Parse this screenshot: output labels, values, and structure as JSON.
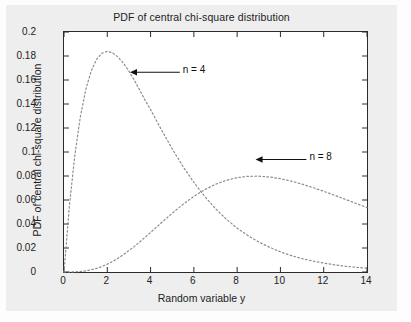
{
  "chart_data": {
    "type": "line",
    "title": "PDF of central chi-square distribution",
    "xlabel": "Random variable y",
    "ylabel": "PDF of central chi-square distribution",
    "xlim": [
      0,
      14
    ],
    "ylim": [
      0,
      0.2
    ],
    "grid": false,
    "legend_position": "none",
    "line_style": "dotted",
    "line_color": "#8c8c8c",
    "axis_color": "#2b2b2b",
    "xticks": [
      "0",
      "2",
      "4",
      "6",
      "8",
      "10",
      "12",
      "14"
    ],
    "xtick_values": [
      0,
      2,
      4,
      6,
      8,
      10,
      12,
      14
    ],
    "yticks": [
      "0",
      "0.02",
      "0.04",
      "0.06",
      "0.08",
      "0.1",
      "0.12",
      "0.14",
      "0.16",
      "0.18",
      "0.2"
    ],
    "ytick_values": [
      0,
      0.02,
      0.04,
      0.06,
      0.08,
      0.1,
      0.12,
      0.14,
      0.16,
      0.18,
      0.2
    ],
    "x": [
      0,
      0.25,
      0.5,
      0.75,
      1,
      1.25,
      1.5,
      1.75,
      2,
      2.25,
      2.5,
      2.75,
      3,
      3.25,
      3.5,
      3.75,
      4,
      4.5,
      5,
      5.5,
      6,
      6.5,
      7,
      7.5,
      8,
      8.5,
      9,
      9.5,
      10,
      10.5,
      11,
      11.5,
      12,
      12.5,
      13,
      13.5,
      14
    ],
    "series": [
      {
        "name": "n = 4",
        "label": "n = 4",
        "degrees_of_freedom": 4,
        "peak_x": 2,
        "peak_y": 0.1839,
        "values": [
          0,
          0.0552,
          0.0973,
          0.1288,
          0.1516,
          0.1672,
          0.1771,
          0.1823,
          0.1839,
          0.1826,
          0.1791,
          0.1739,
          0.1673,
          0.1598,
          0.1516,
          0.143,
          0.1353,
          0.1186,
          0.1026,
          0.0879,
          0.0747,
          0.063,
          0.0528,
          0.044,
          0.0366,
          0.0303,
          0.025,
          0.0206,
          0.0168,
          0.0137,
          0.0112,
          0.0091,
          0.0074,
          0.006,
          0.0048,
          0.0039,
          0.0032
        ]
      },
      {
        "name": "n = 8",
        "label": "n = 8",
        "degrees_of_freedom": 8,
        "peak_x": 6,
        "peak_y": 0.112,
        "values": [
          0,
          2e-05,
          0.00013,
          0.00041,
          0.00095,
          0.0018,
          0.003,
          0.00457,
          0.00653,
          0.00886,
          0.01154,
          0.01454,
          0.01783,
          0.02136,
          0.0251,
          0.02898,
          0.03297,
          0.04105,
          0.049,
          0.05641,
          0.06301,
          0.06861,
          0.07309,
          0.07642,
          0.0786,
          0.07972,
          0.07986,
          0.07916,
          0.07773,
          0.07572,
          0.07322,
          0.07037,
          0.06725,
          0.06395,
          0.06055,
          0.05711,
          0.05368
        ]
      }
    ],
    "annotations": [
      {
        "text": "n = 4",
        "target_x": 3.05,
        "target_y": 0.1664,
        "label_x": 5.35,
        "label_y": 0.1664,
        "arrow": "left"
      },
      {
        "text": "n = 8",
        "target_x": 8.85,
        "target_y": 0.0938,
        "label_x": 11.2,
        "label_y": 0.0938,
        "arrow": "left"
      }
    ]
  }
}
